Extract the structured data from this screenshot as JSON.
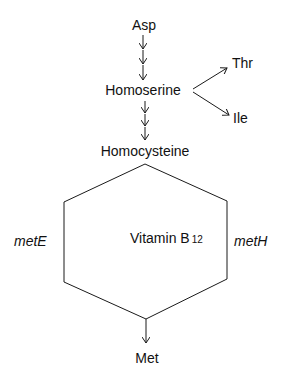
{
  "diagram": {
    "nodes": {
      "asp": "Asp",
      "homoserine": "Homoserine",
      "thr": "Thr",
      "ile": "Ile",
      "homocysteine": "Homocysteine",
      "met": "Met"
    },
    "cofactor": {
      "label": "Vitamin B",
      "subscript": "12"
    },
    "enzymes": {
      "left": "metE",
      "right": "metH"
    },
    "edges": [
      {
        "from": "Asp",
        "to": "Homoserine",
        "steps": 3
      },
      {
        "from": "Homoserine",
        "to": "Thr",
        "steps": 1
      },
      {
        "from": "Homoserine",
        "to": "Ile",
        "steps": 1
      },
      {
        "from": "Homoserine",
        "to": "Homocysteine",
        "steps": 3
      },
      {
        "from": "Homocysteine",
        "to": "Met",
        "via": [
          "metE",
          "metH"
        ]
      }
    ],
    "stroke_color": "#1a1a1a"
  }
}
